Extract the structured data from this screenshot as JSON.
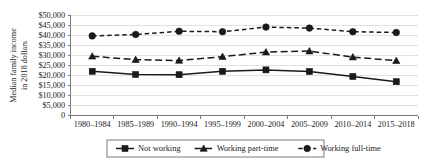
{
  "chart_data": {
    "type": "line",
    "title": "",
    "xlabel": "",
    "ylabel": "Median family income in 2018 dollars",
    "ylabel_line1": "Median family income",
    "ylabel_line2": "in 2018 dollars",
    "ylim": [
      0,
      50000
    ],
    "ytick_step": 5000,
    "grid": true,
    "legend_position": "bottom",
    "categories": [
      "1980–1984",
      "1985–1989",
      "1990–1994",
      "1995–1999",
      "2000–2004",
      "2005–2009",
      "2010–2014",
      "2015–2018"
    ],
    "ytick_labels": [
      "$50,000",
      "$45,000",
      "$40,000",
      "$35,000",
      "$30,000",
      "$25,000",
      "$20,000",
      "$15,000",
      "$10,000",
      "$5,000",
      "0"
    ],
    "ytick_values": [
      50000,
      45000,
      40000,
      35000,
      30000,
      25000,
      20000,
      15000,
      10000,
      5000,
      0
    ],
    "series": [
      {
        "name": "Not working",
        "marker": "square",
        "dash": "solid",
        "color": "#1a1a1a",
        "values": [
          22100,
          20500,
          20400,
          22100,
          22800,
          22000,
          19500,
          16900
        ]
      },
      {
        "name": "Working part-time",
        "marker": "triangle",
        "dash": "dashed",
        "color": "#1a1a1a",
        "values": [
          29600,
          27900,
          27500,
          29400,
          31700,
          32200,
          29200,
          27400
        ]
      },
      {
        "name": "Working full-time",
        "marker": "circle",
        "dash": "dotted-dash",
        "color": "#1a1a1a",
        "values": [
          39800,
          40500,
          42100,
          41900,
          44200,
          43700,
          41900,
          41500
        ]
      }
    ]
  }
}
